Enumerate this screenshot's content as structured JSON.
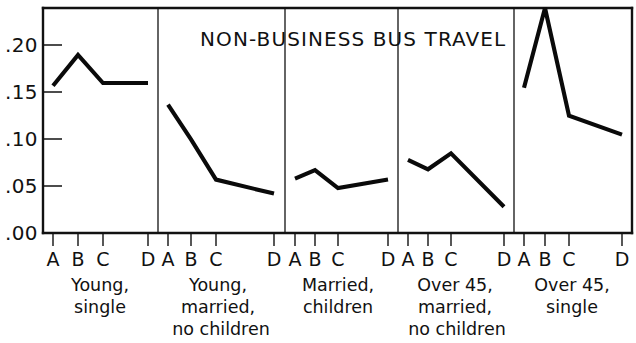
{
  "chart_data": {
    "type": "line",
    "title": "NON-BUSINESS BUS TRAVEL",
    "xlabel": "",
    "ylabel": "",
    "ylim": [
      0.0,
      0.24
    ],
    "grid": false,
    "legend": null,
    "yticks": [
      0.0,
      0.05,
      0.1,
      0.15,
      0.2
    ],
    "ytick_labels": [
      ".00",
      ".05",
      ".10",
      ".15",
      ".20"
    ],
    "categories": [
      "A",
      "B",
      "C",
      "D"
    ],
    "panels": [
      {
        "name": "Young, single",
        "label_lines": [
          "Young,",
          "single"
        ],
        "categories": [
          "A",
          "B",
          "C",
          "D"
        ],
        "values": [
          0.157,
          0.19,
          0.16,
          0.16
        ]
      },
      {
        "name": "Young, married, no children",
        "label_lines": [
          "Young,",
          "married,",
          "no children"
        ],
        "categories": [
          "A",
          "B",
          "C",
          "D"
        ],
        "values": [
          0.137,
          0.1,
          0.057,
          0.042
        ]
      },
      {
        "name": "Married, children",
        "label_lines": [
          "Married,",
          "children"
        ],
        "categories": [
          "A",
          "B",
          "C",
          "D"
        ],
        "values": [
          0.058,
          0.067,
          0.048,
          0.057
        ]
      },
      {
        "name": "Over 45, married, no children",
        "label_lines": [
          "Over 45,",
          "married,",
          "no children"
        ],
        "categories": [
          "A",
          "B",
          "C",
          "D"
        ],
        "values": [
          0.078,
          0.068,
          0.085,
          0.028
        ]
      },
      {
        "name": "Over 45, single",
        "label_lines": [
          "Over 45,",
          "single"
        ],
        "categories": [
          "A",
          "B",
          "C",
          "D"
        ],
        "values": [
          0.155,
          0.24,
          0.125,
          0.105
        ]
      }
    ]
  },
  "axis": {
    "ytick_labels": [
      ".20",
      ".15",
      ".10",
      ".05",
      ".00"
    ],
    "xtick_labels": [
      "A",
      "B",
      "C",
      "D"
    ]
  },
  "title": {
    "text": "NON-BUSINESS BUS TRAVEL"
  },
  "groups": [
    {
      "line1": "Young,",
      "line2": "single",
      "line3": ""
    },
    {
      "line1": "Young,",
      "line2": "married,",
      "line3": "no children"
    },
    {
      "line1": "Married,",
      "line2": "children",
      "line3": ""
    },
    {
      "line1": "Over 45,",
      "line2": "married,",
      "line3": "no children"
    },
    {
      "line1": "Over 45,",
      "line2": "single",
      "line3": ""
    }
  ],
  "colors": {
    "ink": "#111111",
    "series": "#0a0a0a",
    "background": "#ffffff"
  }
}
